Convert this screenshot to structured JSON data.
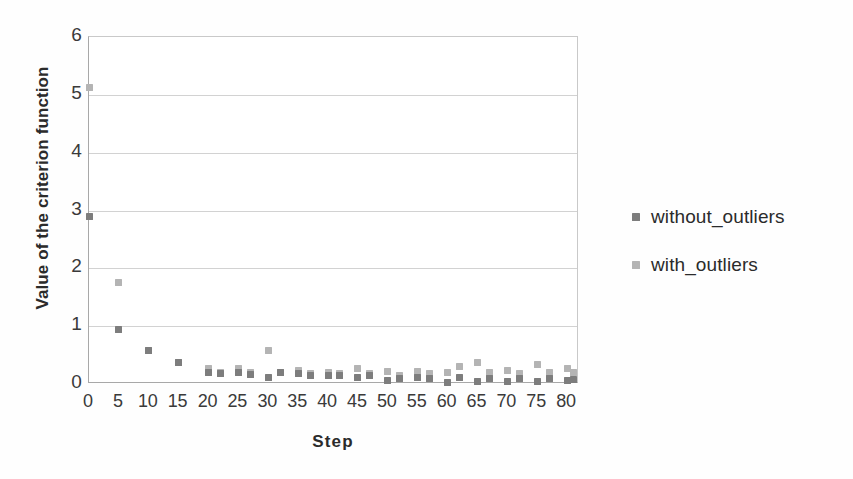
{
  "chart_data": {
    "type": "scatter",
    "title": "",
    "xlabel": "Step",
    "ylabel": "Value of the criterion function",
    "xlim": [
      0,
      82
    ],
    "ylim": [
      0,
      6
    ],
    "xticks": [
      0,
      5,
      10,
      15,
      20,
      25,
      30,
      35,
      40,
      45,
      50,
      55,
      60,
      65,
      70,
      75,
      80
    ],
    "yticks": [
      0,
      1,
      2,
      3,
      4,
      5,
      6
    ],
    "grid": "horizontal",
    "legend_position": "right",
    "series": [
      {
        "name": "without_outliers",
        "color": "#7d7d7d",
        "marker": "square",
        "x": [
          0,
          5,
          10,
          15,
          20,
          22,
          25,
          27,
          30,
          32,
          35,
          37,
          40,
          42,
          45,
          47,
          50,
          52,
          55,
          57,
          60,
          62,
          65,
          67,
          70,
          72,
          75,
          77,
          80,
          81
        ],
        "y": [
          2.9,
          0.95,
          0.58,
          0.38,
          0.2,
          0.18,
          0.2,
          0.17,
          0.12,
          0.2,
          0.18,
          0.14,
          0.15,
          0.15,
          0.12,
          0.14,
          0.06,
          0.1,
          0.12,
          0.1,
          0.02,
          0.12,
          0.04,
          0.1,
          0.05,
          0.1,
          0.04,
          0.1,
          0.06,
          0.08
        ]
      },
      {
        "name": "with_outliers",
        "color": "#b4b4b4",
        "marker": "square",
        "x": [
          0,
          5,
          10,
          15,
          20,
          22,
          25,
          27,
          30,
          32,
          35,
          37,
          40,
          42,
          45,
          47,
          50,
          52,
          55,
          57,
          60,
          62,
          65,
          67,
          70,
          72,
          75,
          77,
          80,
          81
        ],
        "y": [
          5.13,
          1.76,
          0.58,
          0.38,
          0.27,
          0.2,
          0.27,
          0.2,
          0.58,
          0.2,
          0.24,
          0.18,
          0.2,
          0.18,
          0.27,
          0.18,
          0.22,
          0.15,
          0.22,
          0.18,
          0.2,
          0.3,
          0.38,
          0.2,
          0.24,
          0.18,
          0.34,
          0.2,
          0.27,
          0.2
        ]
      }
    ]
  }
}
